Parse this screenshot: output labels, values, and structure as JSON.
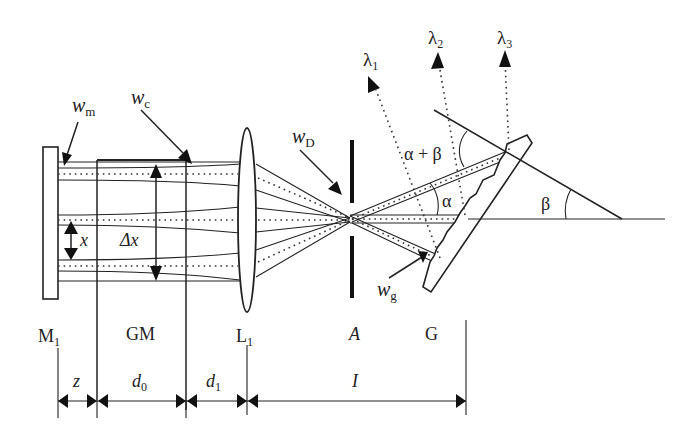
{
  "figure": {
    "type": "optical-setup-diagram",
    "components": {
      "mirror": "M",
      "mirror_sub": "1",
      "gain_medium": "GM",
      "lens": "L",
      "lens_sub": "1",
      "aperture": "A",
      "grating": "G"
    },
    "beam_labels": {
      "w_m": {
        "main": "w",
        "sub": "m"
      },
      "w_c": {
        "main": "w",
        "sub": "c"
      },
      "w_D": {
        "main": "w",
        "sub": "D"
      },
      "w_g": {
        "main": "w",
        "sub": "g"
      }
    },
    "spacing_labels": {
      "x": "x",
      "delta_x": "Δx"
    },
    "wavelengths": [
      {
        "main": "λ",
        "sub": "1"
      },
      {
        "main": "λ",
        "sub": "2"
      },
      {
        "main": "λ",
        "sub": "3"
      }
    ],
    "angles": {
      "alpha_plus_beta": "α + β",
      "alpha": "α",
      "beta": "β"
    },
    "distances": [
      {
        "main": "z",
        "sub": ""
      },
      {
        "main": "d",
        "sub": "0"
      },
      {
        "main": "d",
        "sub": "1"
      },
      {
        "main": "I",
        "sub": ""
      }
    ]
  }
}
